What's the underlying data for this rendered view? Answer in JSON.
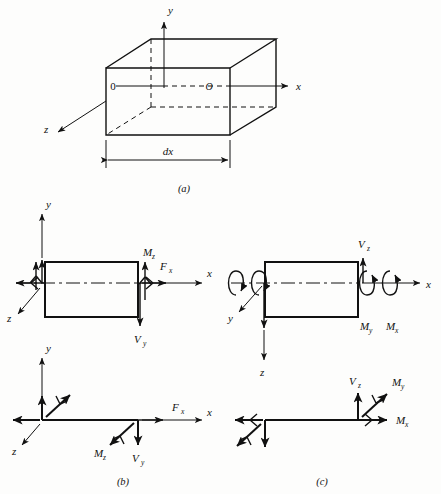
{
  "figure": {
    "background": "#fdfdfc",
    "ink": "#111111"
  },
  "panels": [
    {
      "id": "a",
      "label": "(a)",
      "kind": "3d-box",
      "axes": [
        {
          "name": "y",
          "label": "y",
          "direction": "up"
        },
        {
          "name": "x",
          "label": "x",
          "direction": "right"
        },
        {
          "name": "z",
          "label": "z",
          "direction": "down-left"
        }
      ],
      "origins": [
        {
          "label": "0",
          "style": "upright",
          "face": "near-left"
        },
        {
          "label": "O",
          "style": "italic",
          "face": "far-right"
        }
      ],
      "dimension": {
        "label": "dx",
        "style": "italic",
        "ends": "both-arrows"
      }
    },
    {
      "id": "b",
      "label": "(b)",
      "kind": "xy-plane-element",
      "axes": [
        {
          "name": "y",
          "label": "y",
          "direction": "up"
        },
        {
          "name": "x",
          "label": "x",
          "direction": "right"
        },
        {
          "name": "z",
          "label": "z",
          "direction": "down-left"
        }
      ],
      "left_face_loads": [
        {
          "symbol": "F",
          "sub": "x",
          "glyph": "double-arrow-left",
          "shown_label": false
        },
        {
          "symbol": "V",
          "sub": "y",
          "glyph": "arrow-up",
          "shown_label": false
        },
        {
          "symbol": "M",
          "sub": "z",
          "glyph": "double-arrow-up",
          "shown_label": false
        }
      ],
      "right_face_loads": [
        {
          "symbol": "M",
          "sub": "z",
          "glyph": "double-arrow-up",
          "label": "M",
          "sublabel": "z"
        },
        {
          "symbol": "F",
          "sub": "x",
          "glyph": "double-arrow-right",
          "label": "F",
          "sublabel": "x"
        },
        {
          "symbol": "V",
          "sub": "y",
          "glyph": "arrow-down",
          "label": "V",
          "sublabel": "y"
        }
      ],
      "line_diagram": {
        "left_end": [
          {
            "glyph": "arrow-left",
            "name": "Fx"
          },
          {
            "glyph": "arrow-up",
            "name": "Vy"
          },
          {
            "glyph": "double-arrow-diag-up-right",
            "name": "Mz"
          }
        ],
        "right_end": [
          {
            "glyph": "arrow-right",
            "label": "F",
            "sublabel": "x"
          },
          {
            "glyph": "arrow-down",
            "label": "V",
            "sublabel": "y"
          },
          {
            "glyph": "double-arrow-diag-down-left",
            "label": "M",
            "sublabel": "z"
          }
        ]
      }
    },
    {
      "id": "c",
      "label": "(c)",
      "kind": "xz-plane-element",
      "axes": [
        {
          "name": "x",
          "label": "x",
          "direction": "right"
        },
        {
          "name": "y",
          "label": "y",
          "direction": "down-left"
        },
        {
          "name": "z",
          "label": "z",
          "direction": "down"
        }
      ],
      "left_face_loads": [
        {
          "symbol": "M",
          "sub": "y",
          "glyph": "curved-hook-arrow",
          "shown_label": false
        },
        {
          "symbol": "M",
          "sub": "x",
          "glyph": "curved-hook-arrow",
          "shown_label": false
        },
        {
          "symbol": "V",
          "sub": "z",
          "glyph": "arrow-down",
          "shown_label": false
        }
      ],
      "right_face_loads": [
        {
          "symbol": "V",
          "sub": "z",
          "glyph": "arrow-up",
          "label": "V",
          "sublabel": "z"
        },
        {
          "symbol": "M",
          "sub": "y",
          "glyph": "curved-hook-arrow",
          "label": "M",
          "sublabel": "y"
        },
        {
          "symbol": "M",
          "sub": "x",
          "glyph": "curved-hook-arrow",
          "label": "M",
          "sublabel": "x"
        }
      ],
      "line_diagram": {
        "left_end": [
          {
            "glyph": "double-arrow-left",
            "name": "Mx"
          },
          {
            "glyph": "double-arrow-diag-down-left",
            "name": "My"
          },
          {
            "glyph": "arrow-down",
            "name": "Vz"
          }
        ],
        "right_end": [
          {
            "glyph": "arrow-up",
            "label": "V",
            "sublabel": "z"
          },
          {
            "glyph": "double-arrow-diag-up-right",
            "label": "M",
            "sublabel": "y"
          },
          {
            "glyph": "double-arrow-right",
            "label": "M",
            "sublabel": "x"
          }
        ]
      }
    }
  ],
  "labels": {
    "y": "y",
    "x": "x",
    "z": "z",
    "dx": "dx",
    "zero": "0",
    "bigO": "O",
    "M": "M",
    "V": "V",
    "F": "F",
    "sub_x": "x",
    "sub_y": "y",
    "sub_z": "z",
    "panel_a": "(a)",
    "panel_b": "(b)",
    "panel_c": "(c)"
  }
}
